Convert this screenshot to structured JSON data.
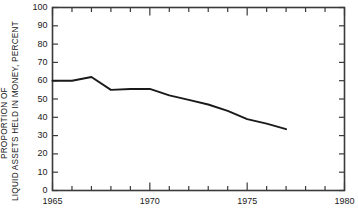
{
  "chart_data": {
    "type": "line",
    "title": "",
    "subtitle": "",
    "xlabel": "",
    "ylabel": "PROPORTION OF LIQUID ASSETS HELD IN MONEY, PERCENT",
    "ylabel_lines": [
      "PROPORTION OF",
      "LIQUID ASSETS HELD IN MONEY, PERCENT"
    ],
    "xlim": [
      1965,
      1980
    ],
    "ylim": [
      0,
      100
    ],
    "ytick_values": [
      0,
      10,
      20,
      30,
      40,
      50,
      60,
      70,
      80,
      90,
      100
    ],
    "ytick_labels": [
      "0",
      "10",
      "20",
      "30",
      "40",
      "50",
      "60",
      "70",
      "80",
      "90",
      "100"
    ],
    "xtick_values": [
      1965,
      1970,
      1975,
      1980
    ],
    "xtick_labels": [
      "1965",
      "1970",
      "1975",
      "1980"
    ],
    "x_minor_step": 1,
    "grid": false,
    "legend": false,
    "legend_position": "none",
    "line_color": "#1a1a1a",
    "line_width": 1.9,
    "axis_color": "#3a3a3a",
    "background_color": "#ffffff",
    "x": [
      1965,
      1966,
      1967,
      1968,
      1969,
      1970,
      1971,
      1972,
      1973,
      1974,
      1975,
      1976,
      1977
    ],
    "values": [
      60.0,
      60.0,
      62.0,
      55.0,
      55.5,
      55.5,
      52.0,
      49.5,
      47.0,
      43.5,
      39.0,
      36.5,
      33.5
    ],
    "series": [
      {
        "name": "Proportion of liquid assets held in money",
        "values": [
          60.0,
          60.0,
          62.0,
          55.0,
          55.5,
          55.5,
          52.0,
          49.5,
          47.0,
          43.5,
          39.0,
          36.5,
          33.5
        ]
      }
    ],
    "annotations": []
  }
}
